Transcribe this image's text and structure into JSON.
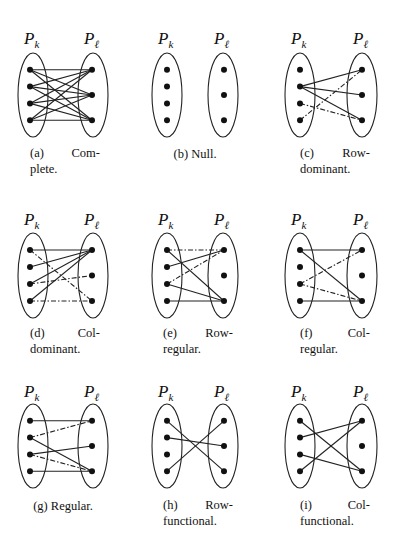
{
  "figure": {
    "left_set_label": "P",
    "left_set_sub": "k",
    "right_set_label": "P",
    "right_set_sub": "ℓ",
    "edge_styles": {
      "solid": "solid",
      "dashdot": "dash-dot"
    },
    "panels": [
      {
        "id": "a",
        "caption_tag": "(a)",
        "caption_word1": "Com-",
        "caption_word2": "plete.",
        "caption_full": "(a) Complete.",
        "left_nodes": 4,
        "right_nodes": 3,
        "edges": [
          {
            "from": 1,
            "to": 1,
            "style": "solid"
          },
          {
            "from": 1,
            "to": 2,
            "style": "solid"
          },
          {
            "from": 1,
            "to": 3,
            "style": "solid"
          },
          {
            "from": 2,
            "to": 1,
            "style": "solid"
          },
          {
            "from": 2,
            "to": 2,
            "style": "solid"
          },
          {
            "from": 2,
            "to": 3,
            "style": "solid"
          },
          {
            "from": 3,
            "to": 1,
            "style": "solid"
          },
          {
            "from": 3,
            "to": 2,
            "style": "solid"
          },
          {
            "from": 3,
            "to": 3,
            "style": "solid"
          },
          {
            "from": 4,
            "to": 1,
            "style": "solid"
          },
          {
            "from": 4,
            "to": 2,
            "style": "solid"
          },
          {
            "from": 4,
            "to": 3,
            "style": "solid"
          }
        ]
      },
      {
        "id": "b",
        "caption_tag": "(b)",
        "caption_word1": "Null.",
        "caption_word2": "",
        "caption_full": "(b) Null.",
        "left_nodes": 4,
        "right_nodes": 3,
        "separated": true,
        "edges": []
      },
      {
        "id": "c",
        "caption_tag": "(c)",
        "caption_word1": "Row-",
        "caption_word2": "dominant.",
        "caption_full": "(c) Row-dominant.",
        "left_nodes": 4,
        "right_nodes": 3,
        "edges": [
          {
            "from": 2,
            "to": 1,
            "style": "solid"
          },
          {
            "from": 2,
            "to": 2,
            "style": "solid"
          },
          {
            "from": 2,
            "to": 3,
            "style": "solid"
          },
          {
            "from": 4,
            "to": 1,
            "style": "dashdot"
          },
          {
            "from": 3,
            "to": 3,
            "style": "dashdot"
          }
        ]
      },
      {
        "id": "d",
        "caption_tag": "(d)",
        "caption_word1": "Col-",
        "caption_word2": "dominant.",
        "caption_full": "(d) Col-dominant.",
        "left_nodes": 4,
        "right_nodes": 3,
        "edges": [
          {
            "from": 1,
            "to": 1,
            "style": "solid"
          },
          {
            "from": 2,
            "to": 1,
            "style": "solid"
          },
          {
            "from": 3,
            "to": 1,
            "style": "solid"
          },
          {
            "from": 4,
            "to": 1,
            "style": "solid"
          },
          {
            "from": 1,
            "to": 3,
            "style": "dashdot"
          },
          {
            "from": 3,
            "to": 2,
            "style": "dashdot"
          },
          {
            "from": 4,
            "to": 3,
            "style": "dashdot"
          }
        ]
      },
      {
        "id": "e",
        "caption_tag": "(e)",
        "caption_word1": "Row-",
        "caption_word2": "regular.",
        "caption_full": "(e) Row-regular.",
        "left_nodes": 4,
        "right_nodes": 3,
        "edges": [
          {
            "from": 1,
            "to": 1,
            "style": "dashdot"
          },
          {
            "from": 2,
            "to": 1,
            "style": "solid"
          },
          {
            "from": 3,
            "to": 1,
            "style": "dashdot"
          },
          {
            "from": 1,
            "to": 3,
            "style": "solid"
          },
          {
            "from": 3,
            "to": 3,
            "style": "solid"
          },
          {
            "from": 4,
            "to": 3,
            "style": "solid"
          }
        ]
      },
      {
        "id": "f",
        "caption_tag": "(f)",
        "caption_word1": "Col-",
        "caption_word2": "regular.",
        "caption_full": "(f) Col-regular.",
        "left_nodes": 4,
        "right_nodes": 3,
        "edges": [
          {
            "from": 1,
            "to": 1,
            "style": "solid"
          },
          {
            "from": 1,
            "to": 3,
            "style": "solid"
          },
          {
            "from": 3,
            "to": 1,
            "style": "dashdot"
          },
          {
            "from": 3,
            "to": 3,
            "style": "dashdot"
          },
          {
            "from": 4,
            "to": 3,
            "style": "solid"
          }
        ]
      },
      {
        "id": "g",
        "caption_tag": "(g)",
        "caption_word1": "Regular.",
        "caption_word2": "",
        "caption_full": "(g) Regular.",
        "left_nodes": 4,
        "right_nodes": 3,
        "edges": [
          {
            "from": 1,
            "to": 1,
            "style": "solid"
          },
          {
            "from": 2,
            "to": 1,
            "style": "dashdot"
          },
          {
            "from": 2,
            "to": 3,
            "style": "solid"
          },
          {
            "from": 3,
            "to": 2,
            "style": "solid"
          },
          {
            "from": 3,
            "to": 3,
            "style": "dashdot"
          },
          {
            "from": 4,
            "to": 3,
            "style": "solid"
          }
        ]
      },
      {
        "id": "h",
        "caption_tag": "(h)",
        "caption_word1": "Row-",
        "caption_word2": "functional.",
        "caption_full": "(h) Row-functional.",
        "left_nodes": 4,
        "right_nodes": 3,
        "edges": [
          {
            "from": 1,
            "to": 3,
            "style": "solid"
          },
          {
            "from": 2,
            "to": 2,
            "style": "solid"
          },
          {
            "from": 4,
            "to": 1,
            "style": "solid"
          }
        ]
      },
      {
        "id": "i",
        "caption_tag": "(i)",
        "caption_word1": "Col-",
        "caption_word2": "functional.",
        "caption_full": "(i) Col-functional.",
        "left_nodes": 4,
        "right_nodes": 3,
        "edges": [
          {
            "from": 1,
            "to": 3,
            "style": "solid"
          },
          {
            "from": 2,
            "to": 1,
            "style": "solid"
          },
          {
            "from": 3,
            "to": 3,
            "style": "solid"
          },
          {
            "from": 4,
            "to": 1,
            "style": "solid"
          }
        ]
      }
    ]
  }
}
